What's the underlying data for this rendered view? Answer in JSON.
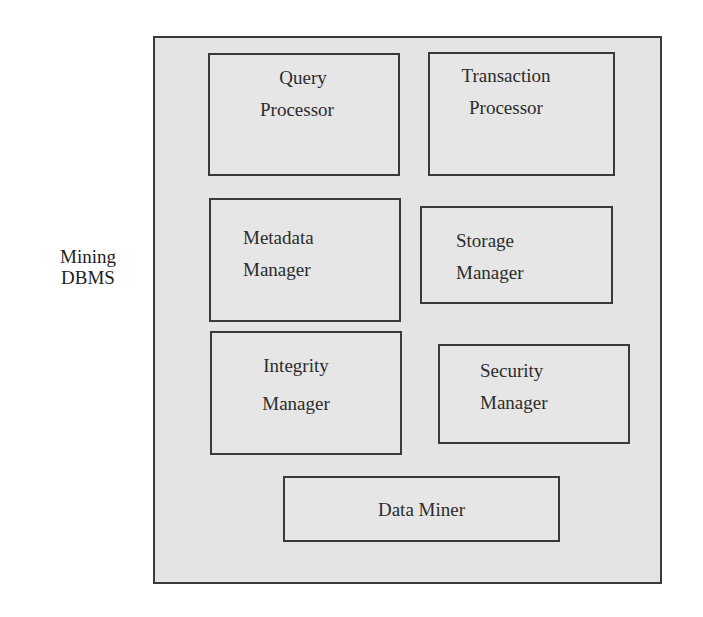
{
  "diagram": {
    "side_label": {
      "line1": "Mining",
      "line2": "DBMS"
    },
    "container": {
      "name": "Mining DBMS"
    },
    "components": [
      {
        "id": "query-processor",
        "line1": "Query",
        "line2": "Processor"
      },
      {
        "id": "transaction-processor",
        "line1": "Transaction",
        "line2": "Processor"
      },
      {
        "id": "metadata-manager",
        "line1": "Metadata",
        "line2": "Manager"
      },
      {
        "id": "storage-manager",
        "line1": "Storage",
        "line2": "Manager"
      },
      {
        "id": "integrity-manager",
        "line1": "Integrity",
        "line2": "Manager"
      },
      {
        "id": "security-manager",
        "line1": "Security",
        "line2": "Manager"
      },
      {
        "id": "data-miner",
        "line1": "Data Miner"
      }
    ],
    "colors": {
      "fill": "#e4e4e4",
      "stroke": "#3a3a3a",
      "text": "#2c2c2c"
    }
  }
}
